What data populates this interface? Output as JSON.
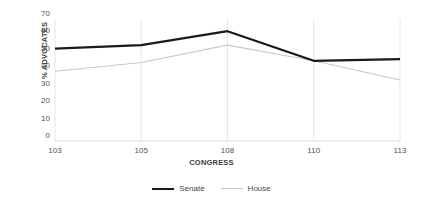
{
  "chart_data": {
    "type": "line",
    "title": "",
    "xlabel": "CONGRESS",
    "ylabel": "% ADVOCATES",
    "categories": [
      "103",
      "105",
      "108",
      "110",
      "113"
    ],
    "series": [
      {
        "name": "Senate",
        "values": [
          53,
          55,
          63,
          46,
          47
        ],
        "color": "#1a1a1a",
        "width": 2.2
      },
      {
        "name": "House",
        "values": [
          40,
          45,
          55,
          46,
          35
        ],
        "color": "#c8c8c8",
        "width": 1.1
      }
    ],
    "ylim": [
      0,
      70
    ],
    "yticks": [
      0,
      10,
      20,
      30,
      40,
      50,
      60,
      70
    ],
    "grid": "vertical-category-lines",
    "grid_color": "#e6e6e6",
    "axis_color": "#d9d9d9",
    "legend_position": "bottom-center",
    "background": "#ffffff"
  }
}
